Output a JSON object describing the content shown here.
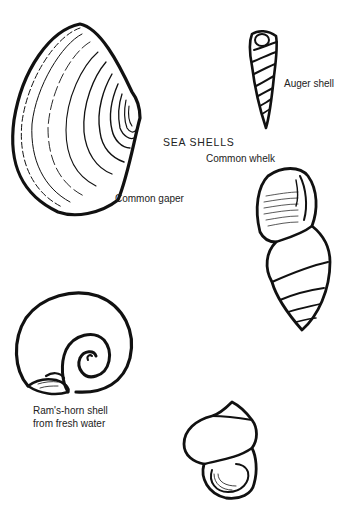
{
  "title": "SEA SHELLS",
  "shells": [
    {
      "id": "common-gaper",
      "label": "Common gaper"
    },
    {
      "id": "auger-shell",
      "label": "Auger shell"
    },
    {
      "id": "common-whelk",
      "label": "Common whelk"
    },
    {
      "id": "rams-horn-shell",
      "label_line1": "Ram's-horn shell",
      "label_line2": "from fresh water"
    },
    {
      "id": "pond-snail",
      "label": ""
    }
  ]
}
